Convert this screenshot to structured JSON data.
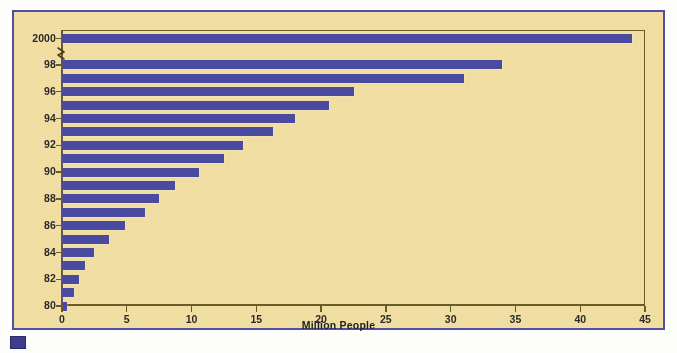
{
  "figure": {
    "frame_color": "#4f4fa6",
    "panel_background": "#f2dfa3",
    "axis_color": "#6b5b24",
    "bar_color": "#4a4aa0"
  },
  "footer": {
    "mark_name": "color-swatch"
  },
  "chart_data": {
    "type": "bar",
    "orientation": "horizontal",
    "title": "",
    "subtitle": "",
    "xlabel": "Million People",
    "ylabel": "",
    "xlim": [
      0,
      45
    ],
    "ylim": null,
    "grid": false,
    "legend": null,
    "x_ticks": [
      0,
      5,
      10,
      15,
      20,
      25,
      30,
      35,
      40,
      45
    ],
    "x_tick_labels": [
      "0",
      "5",
      "10",
      "15",
      "20",
      "25",
      "30",
      "35",
      "40",
      "45"
    ],
    "y_tick_labels": [
      "2000",
      "98",
      "96",
      "94",
      "92",
      "90",
      "88",
      "86",
      "84",
      "82",
      "80"
    ],
    "y_axis_break": true,
    "y_axis_break_note": "zigzag break between 2000 and 98",
    "categories": [
      "2000",
      "98",
      "97",
      "96",
      "95",
      "94",
      "93",
      "92",
      "91",
      "90",
      "89",
      "88",
      "87",
      "86",
      "85",
      "84",
      "83",
      "82",
      "81",
      "80"
    ],
    "values": [
      44.0,
      34.0,
      31.0,
      22.5,
      20.6,
      18.0,
      16.3,
      14.0,
      12.5,
      10.6,
      8.7,
      7.5,
      6.4,
      4.9,
      3.6,
      2.5,
      1.8,
      1.3,
      0.9,
      0.4
    ],
    "series": [
      {
        "name": "Million People",
        "values": [
          44.0,
          34.0,
          31.0,
          22.5,
          20.6,
          18.0,
          16.3,
          14.0,
          12.5,
          10.6,
          8.7,
          7.5,
          6.4,
          4.9,
          3.6,
          2.5,
          1.8,
          1.3,
          0.9,
          0.4
        ]
      }
    ]
  }
}
